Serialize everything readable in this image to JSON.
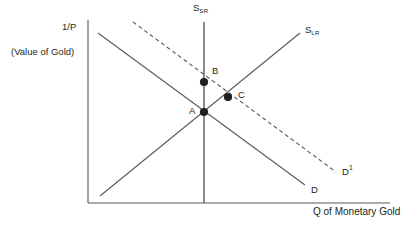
{
  "figure": {
    "type": "economics-supply-demand-diagram",
    "background_color": "#ffffff",
    "line_color": "#58595b",
    "text_color": "#231f20",
    "point_color": "#231f20"
  },
  "axes": {
    "y_label_line1": "1/P",
    "y_label_line2": "(Value of Gold)",
    "x_label": "Q of Monetary Gold",
    "origin": {
      "x": 88,
      "y": 203
    },
    "y_axis_top": 20,
    "x_axis_right": 390
  },
  "curves": [
    {
      "id": "s-sr",
      "label_text": "S",
      "label_sub": "SR",
      "name": "short-run-supply",
      "style": "solid",
      "x1": 204,
      "y1": 22,
      "x2": 204,
      "y2": 203,
      "label_x": 193,
      "label_y": 3
    },
    {
      "id": "s-lr",
      "label_text": "S",
      "label_sub": "LR",
      "name": "long-run-supply",
      "style": "solid",
      "x1": 100,
      "y1": 196,
      "x2": 300,
      "y2": 33,
      "label_x": 305,
      "label_y": 25
    },
    {
      "id": "d",
      "label_text": "D",
      "label_sub": "",
      "name": "demand-original",
      "style": "solid",
      "x1": 98,
      "y1": 33,
      "x2": 305,
      "y2": 185,
      "label_x": 311,
      "label_y": 185
    },
    {
      "id": "d1",
      "label_text": "D",
      "label_sup": "1",
      "name": "demand-shifted",
      "style": "dashed",
      "x1": 133,
      "y1": 22,
      "x2": 336,
      "y2": 172,
      "label_x": 342,
      "label_y": 166
    }
  ],
  "points": [
    {
      "id": "A",
      "label": "A",
      "x": 204,
      "y": 112,
      "label_x": 189,
      "label_y": 106,
      "radius": 4.1
    },
    {
      "id": "B",
      "label": "B",
      "x": 204,
      "y": 82,
      "label_x": 212,
      "label_y": 66,
      "radius": 4.1
    },
    {
      "id": "C",
      "label": "C",
      "x": 228,
      "y": 97,
      "label_x": 238,
      "label_y": 90,
      "radius": 4.1
    }
  ],
  "chart_data": {
    "type": "line",
    "title": "",
    "xlabel": "Q of Monetary Gold",
    "ylabel": "1/P (Value of Gold)",
    "grid": false,
    "legend": "inline-curve-labels",
    "series": [
      {
        "name": "S_SR",
        "description": "Short-run supply, vertical (perfectly inelastic)",
        "style": "solid",
        "points": [
          [
            204,
            22
          ],
          [
            204,
            203
          ]
        ]
      },
      {
        "name": "S_LR",
        "description": "Long-run supply, upward sloping",
        "style": "solid",
        "points": [
          [
            100,
            196
          ],
          [
            300,
            33
          ]
        ]
      },
      {
        "name": "D",
        "description": "Original demand, downward sloping",
        "style": "solid",
        "points": [
          [
            98,
            33
          ],
          [
            305,
            185
          ]
        ]
      },
      {
        "name": "D1",
        "description": "Shifted demand, downward sloping, shifted right/up",
        "style": "dashed",
        "points": [
          [
            133,
            22
          ],
          [
            336,
            172
          ]
        ]
      }
    ],
    "annotations": [
      {
        "label": "A",
        "description": "Initial equilibrium: D intersects S_SR and S_LR",
        "x": 204,
        "y": 112
      },
      {
        "label": "B",
        "description": "Short-run equilibrium after demand shift: D1 intersects S_SR",
        "x": 204,
        "y": 82
      },
      {
        "label": "C",
        "description": "New long-run equilibrium: D1 intersects S_LR",
        "x": 228,
        "y": 97
      }
    ]
  }
}
